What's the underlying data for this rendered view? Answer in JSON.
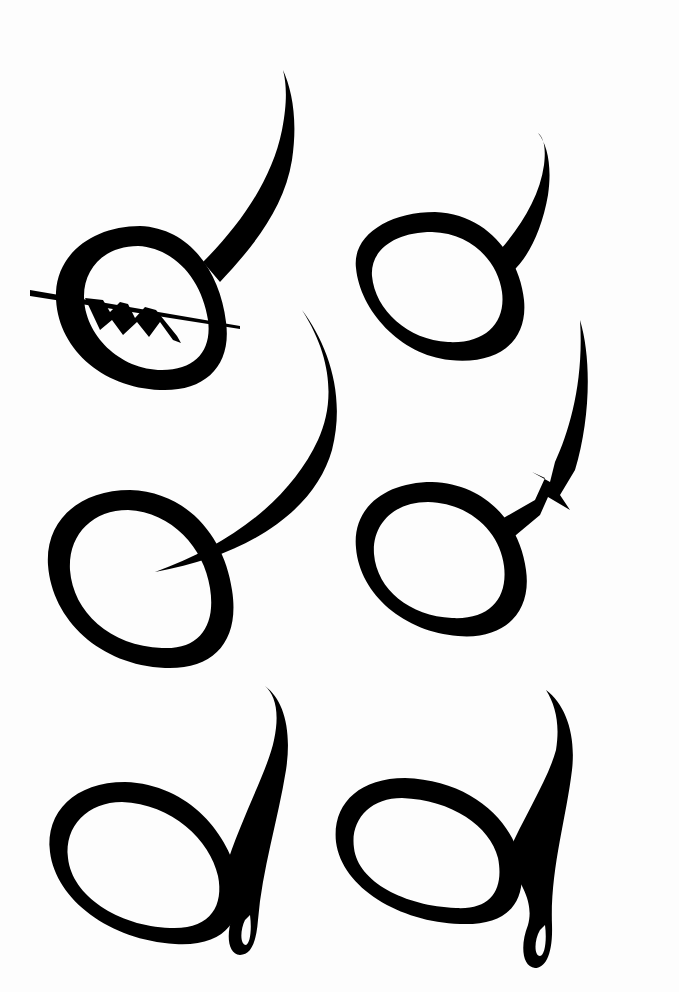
{
  "sheet": {
    "background": "#fdfdfd",
    "ink": "#000000",
    "width": 679,
    "height": 992
  },
  "glyphs": [
    {
      "id": "glyph-1",
      "row": 1,
      "col": 1,
      "description": "ring with tall right ascender, horizontal crossbar and three zigzag diamonds inside"
    },
    {
      "id": "glyph-2",
      "row": 1,
      "col": 2,
      "description": "ring with curved ascender rising from upper right"
    },
    {
      "id": "glyph-3",
      "row": 2,
      "col": 1,
      "description": "open ring with long crescent sweep entering the loop"
    },
    {
      "id": "glyph-4",
      "row": 2,
      "col": 2,
      "description": "ring with ascender broken by a zigzag notch"
    },
    {
      "id": "glyph-5",
      "row": 3,
      "col": 1,
      "description": "ring with looped descender and tall stem"
    },
    {
      "id": "glyph-6",
      "row": 3,
      "col": 2,
      "description": "ring with looped descender and tall stem (variant)"
    }
  ]
}
